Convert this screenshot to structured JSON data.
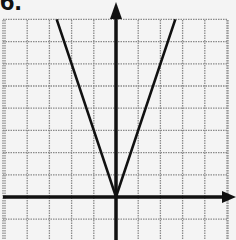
{
  "problem": {
    "label": "6."
  },
  "chart_data": {
    "type": "line",
    "title": "",
    "function": "y = 3|x|",
    "xlabel": "",
    "ylabel": "",
    "grid": true,
    "xlim": [
      -5,
      5
    ],
    "ylim": [
      -2,
      8
    ],
    "axes_arrows": [
      "y-up",
      "x-right"
    ],
    "series": [
      {
        "name": "y = 3|x|",
        "x": [
          -2.67,
          -2,
          -1,
          0,
          1,
          2,
          2.67
        ],
        "y": [
          8,
          6,
          3,
          0,
          3,
          6,
          8
        ]
      }
    ],
    "vertex": [
      0,
      0
    ]
  },
  "colors": {
    "background": "#f4f4f4",
    "grid": "#8a8a8a",
    "axis": "#111111",
    "line": "#111111"
  }
}
